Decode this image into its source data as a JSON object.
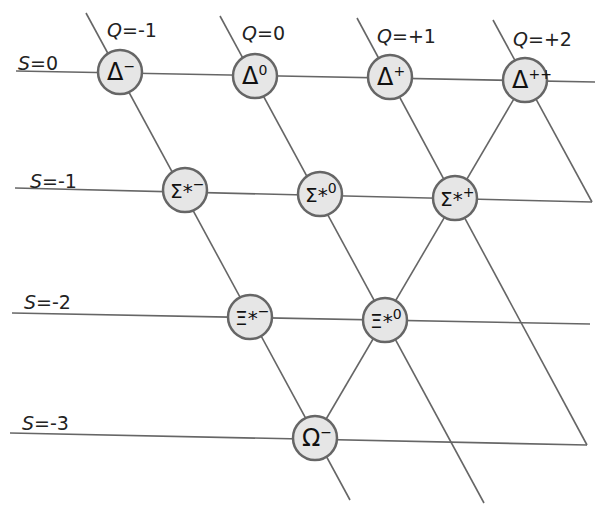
{
  "colors": {
    "line": "#666666",
    "node_fill": "#e6e6e6",
    "node_stroke": "#666666",
    "text": "#222222"
  },
  "strangeness_labels": [
    {
      "var": "S",
      "text": "=0",
      "x": 18,
      "y": 70
    },
    {
      "var": "S",
      "text": "=-1",
      "x": 30,
      "y": 188
    },
    {
      "var": "S",
      "text": "=-2",
      "x": 24,
      "y": 309
    },
    {
      "var": "S",
      "text": "=-3",
      "x": 22,
      "y": 430
    }
  ],
  "charge_labels": [
    {
      "var": "Q",
      "text": "=-1",
      "x": 107,
      "y": 37
    },
    {
      "var": "Q",
      "text": "=0",
      "x": 242,
      "y": 40
    },
    {
      "var": "Q",
      "text": "=+1",
      "x": 377,
      "y": 43
    },
    {
      "var": "Q",
      "text": "=+2",
      "x": 513,
      "y": 46
    }
  ],
  "particles": [
    {
      "id": "delta-minus",
      "symbol": "Δ",
      "sup": "−",
      "S": 0,
      "Q": -1,
      "cx": 120,
      "cy": 72
    },
    {
      "id": "delta-zero",
      "symbol": "Δ",
      "sup": "0",
      "S": 0,
      "Q": 0,
      "cx": 255,
      "cy": 76
    },
    {
      "id": "delta-plus",
      "symbol": "Δ",
      "sup": "+",
      "S": 0,
      "Q": 1,
      "cx": 390,
      "cy": 77
    },
    {
      "id": "delta-plus-plus",
      "symbol": "Δ",
      "sup": "++",
      "S": 0,
      "Q": 2,
      "cx": 525,
      "cy": 80
    },
    {
      "id": "sigma-star-minus",
      "symbol": "Σ*",
      "sup": "−",
      "S": -1,
      "Q": -1,
      "cx": 185,
      "cy": 190
    },
    {
      "id": "sigma-star-zero",
      "symbol": "Σ*",
      "sup": "0",
      "S": -1,
      "Q": 0,
      "cx": 320,
      "cy": 194
    },
    {
      "id": "sigma-star-plus",
      "symbol": "Σ*",
      "sup": "+",
      "S": -1,
      "Q": 1,
      "cx": 455,
      "cy": 198
    },
    {
      "id": "xi-star-minus",
      "symbol": "Ξ*",
      "sup": "−",
      "S": -2,
      "Q": -1,
      "cx": 250,
      "cy": 317
    },
    {
      "id": "xi-star-zero",
      "symbol": "Ξ*",
      "sup": "0",
      "S": -2,
      "Q": 0,
      "cx": 385,
      "cy": 320
    },
    {
      "id": "omega-minus",
      "symbol": "Ω",
      "sup": "−",
      "S": -3,
      "Q": -1,
      "cx": 315,
      "cy": 438
    }
  ],
  "strangeness_lines": [
    {
      "x1": 16,
      "y1": 71,
      "x2": 595,
      "y2": 82
    },
    {
      "x1": 15,
      "y1": 188,
      "x2": 592,
      "y2": 202
    },
    {
      "x1": 12,
      "y1": 313,
      "x2": 590,
      "y2": 324
    },
    {
      "x1": 10,
      "y1": 433,
      "x2": 587,
      "y2": 445
    }
  ],
  "charge_lines": [
    {
      "x1": 86,
      "y1": 13,
      "x2": 350,
      "y2": 500
    },
    {
      "x1": 220,
      "y1": 16,
      "x2": 484,
      "y2": 503
    },
    {
      "x1": 357,
      "y1": 18,
      "x2": 587,
      "y2": 445
    },
    {
      "x1": 493,
      "y1": 20,
      "x2": 592,
      "y2": 202
    }
  ],
  "extra_lines": [
    {
      "x1": 525,
      "y1": 80,
      "x2": 315,
      "y2": 438
    }
  ]
}
